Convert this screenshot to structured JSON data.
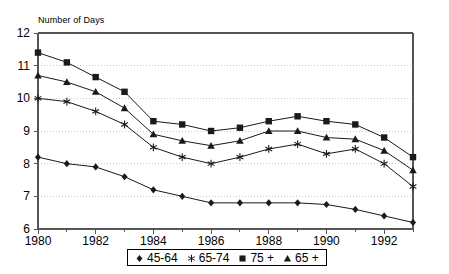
{
  "chart_data": {
    "type": "line",
    "title": "",
    "ylabel": "Number of Days",
    "xlabel": "",
    "grid": true,
    "legend_position": "bottom",
    "xlim": [
      1980,
      1993
    ],
    "ylim": [
      6,
      12
    ],
    "ytick_labels": [
      "12",
      "11",
      "10",
      "9",
      "8",
      "7",
      "6"
    ],
    "ytick_values": [
      12,
      11,
      10,
      9,
      8,
      7,
      6
    ],
    "xtick_labels": [
      "1980",
      "1982",
      "1984",
      "1986",
      "1988",
      "1990",
      "1992"
    ],
    "xtick_values": [
      1980,
      1982,
      1984,
      1986,
      1988,
      1990,
      1992
    ],
    "x": [
      1980,
      1981,
      1982,
      1983,
      1984,
      1985,
      1986,
      1987,
      1988,
      1989,
      1990,
      1991,
      1992,
      1993
    ],
    "series": [
      {
        "name": "45-64",
        "marker": "diamond",
        "values": [
          8.2,
          8.0,
          7.9,
          7.6,
          7.2,
          7.0,
          6.8,
          6.8,
          6.8,
          6.8,
          6.75,
          6.6,
          6.4,
          6.2
        ]
      },
      {
        "name": "65-74",
        "marker": "star",
        "values": [
          10.0,
          9.9,
          9.6,
          9.2,
          8.5,
          8.2,
          8.0,
          8.2,
          8.45,
          8.6,
          8.3,
          8.45,
          8.0,
          7.3
        ]
      },
      {
        "name": "75 +",
        "marker": "square",
        "values": [
          11.4,
          11.1,
          10.65,
          10.2,
          9.3,
          9.2,
          9.0,
          9.1,
          9.3,
          9.45,
          9.3,
          9.2,
          8.8,
          8.2
        ]
      },
      {
        "name": "65 +",
        "marker": "triangle",
        "values": [
          10.7,
          10.5,
          10.2,
          9.7,
          8.9,
          8.7,
          8.55,
          8.7,
          9.0,
          9.0,
          8.8,
          8.75,
          8.4,
          7.8
        ]
      }
    ]
  },
  "legend": {
    "items": [
      {
        "label": "45-64",
        "marker": "diamond"
      },
      {
        "label": "65-74",
        "marker": "star"
      },
      {
        "label": "75 +",
        "marker": "square"
      },
      {
        "label": "65 +",
        "marker": "triangle"
      }
    ]
  },
  "colors": {
    "line": "#1a1a1a",
    "axis": "#555555",
    "grid": "#cccccc",
    "text": "#000000",
    "background": "#ffffff"
  }
}
